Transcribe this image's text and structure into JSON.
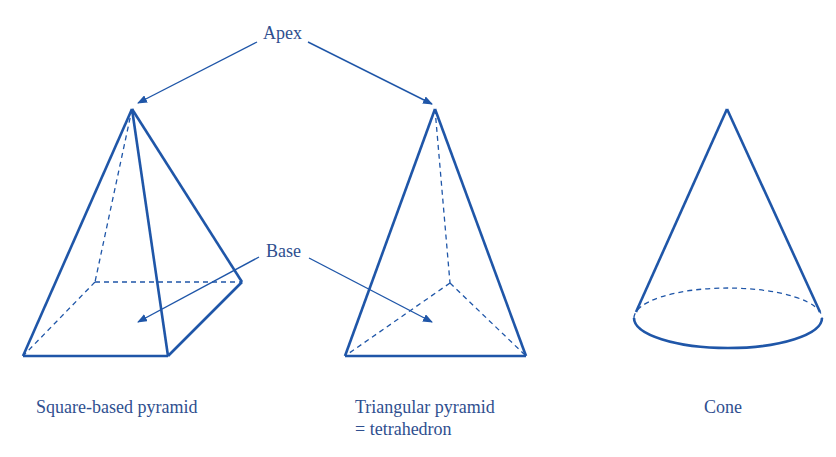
{
  "header": {
    "clipped_text": ""
  },
  "colors": {
    "stroke": "#1f56a8",
    "text": "#2f4f8f",
    "header_text": "#b03a2e"
  },
  "labels": {
    "apex": "Apex",
    "base": "Base"
  },
  "captions": {
    "square": "Square-based pyramid",
    "triangular_line1": "Triangular pyramid",
    "triangular_line2": "= tetrahedron",
    "cone": "Cone"
  }
}
